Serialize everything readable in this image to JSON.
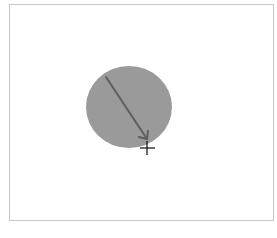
{
  "canvas": {
    "background": "#ffffff",
    "border_color": "#c8c8c8"
  },
  "shape": {
    "type": "circle",
    "fill": "#9a9a9a",
    "cx": 129,
    "cy": 107,
    "rx": 43,
    "ry": 41
  },
  "arrow": {
    "color": "#5e5e5e",
    "x1": 106,
    "y1": 77,
    "x2": 147,
    "y2": 139
  },
  "cursor": {
    "type": "crosshair",
    "x": 147,
    "y": 148,
    "color": "#1a1a1a"
  }
}
